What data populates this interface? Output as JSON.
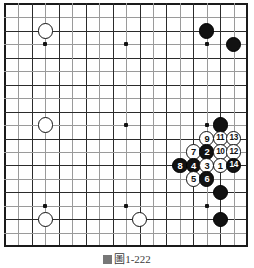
{
  "diagram": {
    "type": "go-board",
    "board_size": 19,
    "star_points": [
      [
        3,
        3
      ],
      [
        3,
        9
      ],
      [
        3,
        15
      ],
      [
        9,
        3
      ],
      [
        9,
        9
      ],
      [
        9,
        15
      ],
      [
        15,
        3
      ],
      [
        15,
        9
      ],
      [
        15,
        15
      ]
    ],
    "caption": "圖1-222",
    "caption_icon": "caption-marker-icon",
    "colors": {
      "line": "#2b2b2b",
      "line_faint": "#9a9a9a",
      "edge": "#1a1a1a",
      "black_stone": "#121212",
      "white_stone": "#ffffff",
      "stone_outline": "#111111",
      "background": "#ffffff"
    },
    "stones": [
      {
        "id": "white-upper-left",
        "color": "white",
        "col": 3,
        "row": 2,
        "label": ""
      },
      {
        "id": "white-left-side",
        "color": "white",
        "col": 3,
        "row": 9,
        "label": ""
      },
      {
        "id": "white-lower-left",
        "color": "white",
        "col": 3,
        "row": 16,
        "label": ""
      },
      {
        "id": "white-lower-center",
        "color": "white",
        "col": 10,
        "row": 16,
        "label": ""
      },
      {
        "id": "black-upper-right-a",
        "color": "black",
        "col": 15,
        "row": 2,
        "label": ""
      },
      {
        "id": "black-upper-right-b",
        "color": "black",
        "col": 17,
        "row": 3,
        "label": ""
      },
      {
        "id": "black-right-side",
        "color": "black",
        "col": 16,
        "row": 9,
        "label": ""
      },
      {
        "id": "black-lower-right-a",
        "color": "black",
        "col": 16,
        "row": 14,
        "label": ""
      },
      {
        "id": "black-lower-right-b",
        "color": "black",
        "col": 16,
        "row": 16,
        "label": ""
      },
      {
        "id": "move-9",
        "color": "white",
        "col": 15,
        "row": 10,
        "label": "9"
      },
      {
        "id": "move-11",
        "color": "white",
        "col": 16,
        "row": 10,
        "label": "11"
      },
      {
        "id": "move-13",
        "color": "white",
        "col": 17,
        "row": 10,
        "label": "13"
      },
      {
        "id": "move-7",
        "color": "white",
        "col": 14,
        "row": 11,
        "label": "7"
      },
      {
        "id": "move-2",
        "color": "black",
        "col": 15,
        "row": 11,
        "label": "2"
      },
      {
        "id": "move-10",
        "color": "white",
        "col": 16,
        "row": 11,
        "label": "10"
      },
      {
        "id": "move-12",
        "color": "white",
        "col": 17,
        "row": 11,
        "label": "12"
      },
      {
        "id": "move-8",
        "color": "black",
        "col": 13,
        "row": 12,
        "label": "8"
      },
      {
        "id": "move-4",
        "color": "black",
        "col": 14,
        "row": 12,
        "label": "4"
      },
      {
        "id": "move-3",
        "color": "white",
        "col": 15,
        "row": 12,
        "label": "3"
      },
      {
        "id": "move-1",
        "color": "white",
        "col": 16,
        "row": 12,
        "label": "1"
      },
      {
        "id": "move-14",
        "color": "black",
        "col": 17,
        "row": 12,
        "label": "14"
      },
      {
        "id": "move-5",
        "color": "white",
        "col": 14,
        "row": 13,
        "label": "5"
      },
      {
        "id": "move-6",
        "color": "black",
        "col": 15,
        "row": 13,
        "label": "6"
      }
    ],
    "move_sequence": [
      {
        "number": 1,
        "color": "white"
      },
      {
        "number": 2,
        "color": "black"
      },
      {
        "number": 3,
        "color": "white"
      },
      {
        "number": 4,
        "color": "black"
      },
      {
        "number": 5,
        "color": "white"
      },
      {
        "number": 6,
        "color": "black"
      },
      {
        "number": 7,
        "color": "white"
      },
      {
        "number": 8,
        "color": "black"
      },
      {
        "number": 9,
        "color": "white"
      },
      {
        "number": 10,
        "color": "white"
      },
      {
        "number": 11,
        "color": "white"
      },
      {
        "number": 12,
        "color": "white"
      },
      {
        "number": 13,
        "color": "white"
      },
      {
        "number": 14,
        "color": "black"
      }
    ]
  }
}
